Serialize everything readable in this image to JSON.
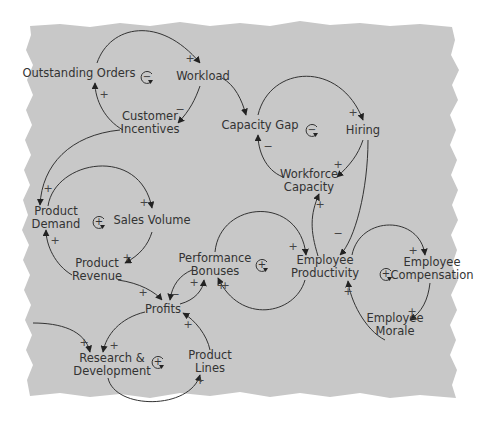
{
  "diagram": {
    "type": "causal-loop-diagram",
    "background_color": "#c8c8c8",
    "nodes": [
      {
        "id": "outstanding_orders",
        "label": "Outstanding Orders",
        "x": 79,
        "y": 73
      },
      {
        "id": "workload",
        "label": "Workload",
        "x": 203,
        "y": 76
      },
      {
        "id": "customer_incentives",
        "label": "Customer\nIncentives",
        "x": 150,
        "y": 123
      },
      {
        "id": "capacity_gap",
        "label": "Capacity Gap",
        "x": 260,
        "y": 125
      },
      {
        "id": "hiring",
        "label": "Hiring",
        "x": 363,
        "y": 130
      },
      {
        "id": "workforce_capacity",
        "label": "Workforce\nCapacity",
        "x": 309,
        "y": 181
      },
      {
        "id": "product_demand",
        "label": "Product\nDemand",
        "x": 56,
        "y": 218
      },
      {
        "id": "sales_volume",
        "label": "Sales Volume",
        "x": 152,
        "y": 220
      },
      {
        "id": "product_revenue",
        "label": "Product\nRevenue",
        "x": 97,
        "y": 270
      },
      {
        "id": "performance_bonuses",
        "label": "Performance\nBonuses",
        "x": 215,
        "y": 265
      },
      {
        "id": "employee_productivity",
        "label": "Employee\nProductivity",
        "x": 325,
        "y": 267
      },
      {
        "id": "employee_compensation",
        "label": "Employee\nCompensation",
        "x": 432,
        "y": 269
      },
      {
        "id": "employee_morale",
        "label": "Employee\nMorale",
        "x": 395,
        "y": 325
      },
      {
        "id": "profits",
        "label": "Profits",
        "x": 163,
        "y": 309
      },
      {
        "id": "research_development",
        "label": "Research &\nDevelopment",
        "x": 112,
        "y": 365
      },
      {
        "id": "product_lines",
        "label": "Product\nLines",
        "x": 210,
        "y": 362
      }
    ],
    "loops": [
      {
        "sign": "−",
        "x": 147,
        "y": 77
      },
      {
        "sign": "−",
        "x": 312,
        "y": 130
      },
      {
        "sign": "+",
        "x": 99,
        "y": 222
      },
      {
        "sign": "+",
        "x": 262,
        "y": 265
      },
      {
        "sign": "+",
        "x": 386,
        "y": 274
      },
      {
        "sign": "+",
        "x": 158,
        "y": 362
      }
    ],
    "link_signs": [
      {
        "sign": "+",
        "x": 190,
        "y": 58
      },
      {
        "sign": "+",
        "x": 104,
        "y": 94
      },
      {
        "sign": "−",
        "x": 180,
        "y": 109
      },
      {
        "sign": "+",
        "x": 353,
        "y": 112
      },
      {
        "sign": "−",
        "x": 268,
        "y": 146
      },
      {
        "sign": "+",
        "x": 338,
        "y": 164
      },
      {
        "sign": "+",
        "x": 320,
        "y": 204
      },
      {
        "sign": "+",
        "x": 48,
        "y": 188
      },
      {
        "sign": "+",
        "x": 144,
        "y": 202
      },
      {
        "sign": "+",
        "x": 55,
        "y": 240
      },
      {
        "sign": "+",
        "x": 127,
        "y": 257
      },
      {
        "sign": "+",
        "x": 293,
        "y": 246
      },
      {
        "sign": "−",
        "x": 338,
        "y": 233
      },
      {
        "sign": "+",
        "x": 413,
        "y": 250
      },
      {
        "sign": "+",
        "x": 412,
        "y": 311
      },
      {
        "sign": "+",
        "x": 348,
        "y": 291
      },
      {
        "sign": "+",
        "x": 194,
        "y": 282
      },
      {
        "sign": "+",
        "x": 225,
        "y": 285
      },
      {
        "sign": "−",
        "x": 175,
        "y": 294
      },
      {
        "sign": "+",
        "x": 221,
        "y": 285
      },
      {
        "sign": "+",
        "x": 143,
        "y": 292
      },
      {
        "sign": "+",
        "x": 188,
        "y": 324
      },
      {
        "sign": "+",
        "x": 84,
        "y": 342
      },
      {
        "sign": "+",
        "x": 114,
        "y": 345
      },
      {
        "sign": "+",
        "x": 200,
        "y": 380
      }
    ]
  }
}
